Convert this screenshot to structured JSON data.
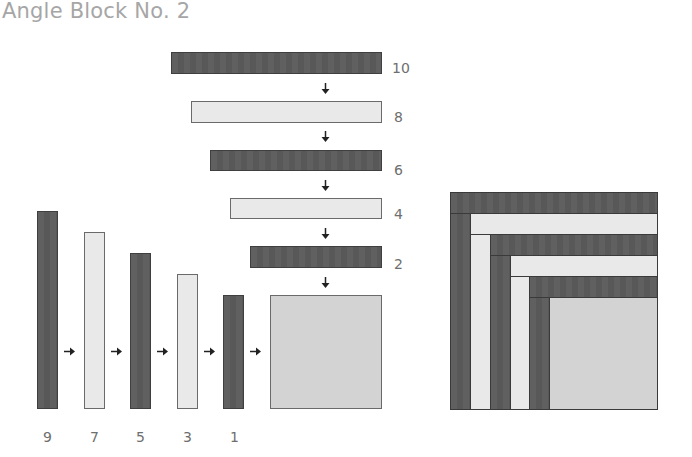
{
  "title": "Angle Block No. 2",
  "colors": {
    "dark": "#5b5b5b",
    "light": "#e9e9e9",
    "center": "#d3d3d3",
    "outline": "#3f3f3f",
    "label_text": "#6e6e6e",
    "title_text": "#a6a6a6"
  },
  "horizontal_strips": [
    {
      "label": "10",
      "tone": "dark"
    },
    {
      "label": "8",
      "tone": "light"
    },
    {
      "label": "6",
      "tone": "dark"
    },
    {
      "label": "4",
      "tone": "light"
    },
    {
      "label": "2",
      "tone": "dark"
    }
  ],
  "vertical_strips": [
    {
      "label": "9",
      "tone": "dark"
    },
    {
      "label": "7",
      "tone": "light"
    },
    {
      "label": "5",
      "tone": "dark"
    },
    {
      "label": "3",
      "tone": "light"
    },
    {
      "label": "1",
      "tone": "dark"
    }
  ],
  "center_square": {
    "tone": "center"
  },
  "arrows": {
    "down_count": 5,
    "right_count": 5
  },
  "completed_block": {
    "description": "assembled angle block",
    "layers": [
      "dark",
      "light",
      "dark",
      "light",
      "dark",
      "center"
    ]
  }
}
